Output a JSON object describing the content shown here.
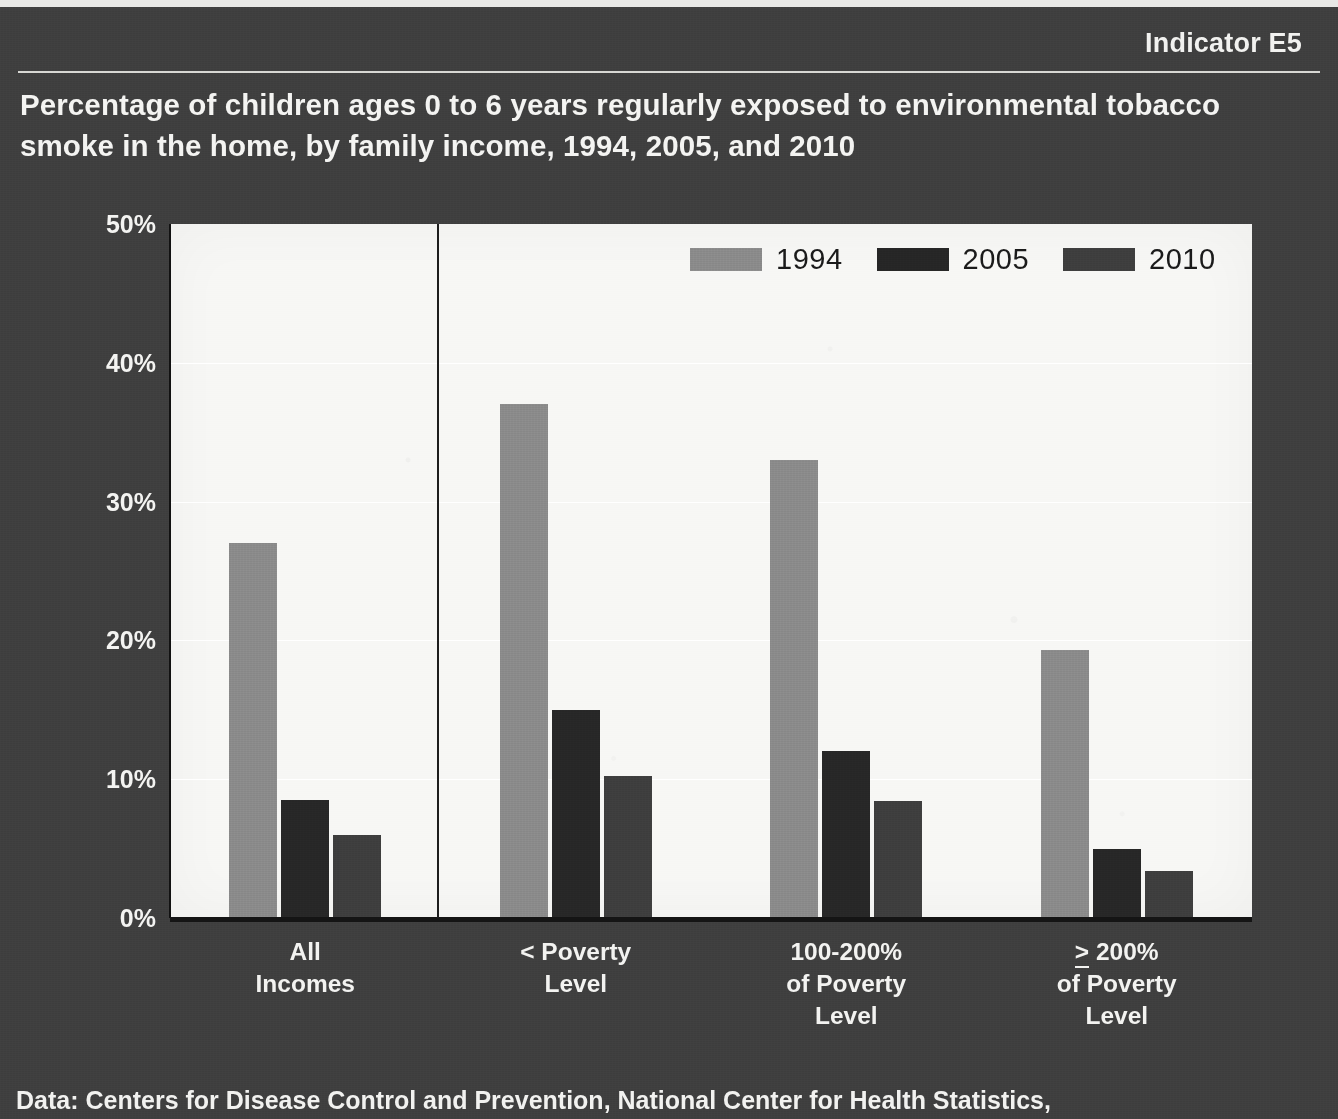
{
  "header": {
    "indicator": "Indicator E5",
    "title": "Percentage of children ages 0 to 6 years regularly exposed to environmental tobacco smoke in the home, by family income, 1994, 2005, and 2010"
  },
  "footer": {
    "source": "Data: Centers for Disease Control and Prevention, National Center for Health Statistics,"
  },
  "colors": {
    "slide_background": "#3f3f3f",
    "plot_background": "#f7f7f5",
    "title_text": "#f4f4f2",
    "series_1994": "#8b8b8b",
    "series_2005": "#272727",
    "series_2010": "#3e3e3e",
    "gridline": "#ffffff",
    "axis": "#141414"
  },
  "chart_data": {
    "type": "bar",
    "title": "Percentage of children ages 0 to 6 years regularly exposed to environmental tobacco smoke in the home, by family income, 1994, 2005, and 2010",
    "xlabel": "",
    "ylabel": "",
    "ylim": [
      0,
      50
    ],
    "ytick_labels": [
      "0%",
      "10%",
      "20%",
      "30%",
      "40%",
      "50%"
    ],
    "ytick_values": [
      0,
      10,
      20,
      30,
      40,
      50
    ],
    "grid": "horizontal",
    "legend_position": "top-right-inside",
    "categories": [
      "All\nIncomes",
      "< Poverty\nLevel",
      "100-200%\nof Poverty\nLevel",
      "≥ 200%\nof Poverty\nLevel"
    ],
    "series": [
      {
        "name": "1994",
        "color": "#8b8b8b",
        "values": [
          27.0,
          37.0,
          33.0,
          19.3
        ]
      },
      {
        "name": "2005",
        "color": "#272727",
        "values": [
          8.5,
          15.0,
          12.0,
          5.0
        ]
      },
      {
        "name": "2010",
        "color": "#3e3e3e",
        "values": [
          6.0,
          10.2,
          8.4,
          3.4
        ]
      }
    ],
    "annotations": [
      {
        "type": "vertical-separator",
        "after_category_index": 0
      }
    ]
  }
}
